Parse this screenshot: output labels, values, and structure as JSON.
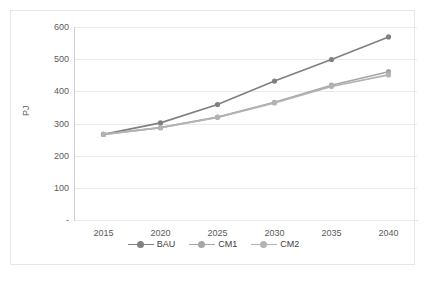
{
  "chart_data": {
    "type": "line",
    "title": "",
    "xlabel": "",
    "ylabel": "PJ",
    "categories": [
      "2015",
      "2020",
      "2025",
      "2030",
      "2035",
      "2040"
    ],
    "x": [
      2015,
      2020,
      2025,
      2030,
      2035,
      2040
    ],
    "series": [
      {
        "name": "BAU",
        "values": [
          266,
          302,
          359,
          432,
          499,
          569
        ],
        "color": "#808080"
      },
      {
        "name": "CM1",
        "values": [
          266,
          287,
          320,
          366,
          419,
          461
        ],
        "color": "#a6a6a6"
      },
      {
        "name": "CM2",
        "values": [
          266,
          287,
          319,
          364,
          415,
          451
        ],
        "color": "#b3b3b3"
      }
    ],
    "ylim": [
      0,
      600
    ],
    "y_ticks": [
      "-",
      "100",
      "200",
      "300",
      "400",
      "500",
      "600"
    ],
    "y_tick_values": [
      0,
      100,
      200,
      300,
      400,
      500,
      600
    ],
    "x_ticks": [
      "2015",
      "2020",
      "2025",
      "2030",
      "2035",
      "2040"
    ],
    "grid": true,
    "legend_position": "bottom",
    "marker": "circle"
  },
  "legend": {
    "items": [
      {
        "label": "BAU"
      },
      {
        "label": "CM1"
      },
      {
        "label": "CM2"
      }
    ]
  },
  "axes": {
    "y_title": "PJ"
  }
}
